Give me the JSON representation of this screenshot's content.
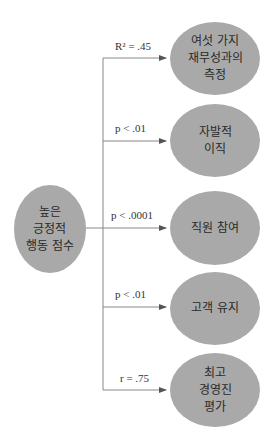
{
  "diagram": {
    "source": {
      "label": "높은\n긍정적\n행동 점수"
    },
    "targets": [
      {
        "label": "여섯 가지\n재무성과의\n측정",
        "stat": "R² = .45"
      },
      {
        "label": "자발적\n이직",
        "stat": "p < .01"
      },
      {
        "label": "직원 참여",
        "stat": "p < .0001"
      },
      {
        "label": "고객 유지",
        "stat": "p < .01"
      },
      {
        "label": "최고\n경영진\n평가",
        "stat": "r = .75"
      }
    ],
    "colors": {
      "node_fill": "#a9a9a9",
      "line": "#777777"
    }
  }
}
